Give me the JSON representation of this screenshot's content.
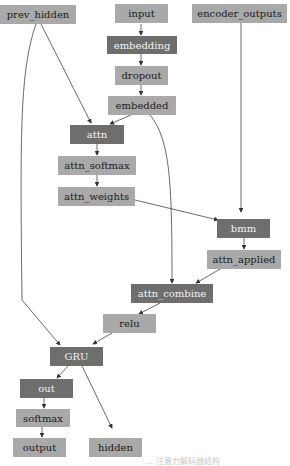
{
  "diagram": {
    "type": "computation-graph",
    "nodes": [
      {
        "id": "prev_hidden",
        "label": "prev_hidden",
        "style": "light"
      },
      {
        "id": "input",
        "label": "input",
        "style": "light"
      },
      {
        "id": "encoder_outputs",
        "label": "encoder_outputs",
        "style": "light"
      },
      {
        "id": "embedding",
        "label": "embedding",
        "style": "dark"
      },
      {
        "id": "dropout",
        "label": "dropout",
        "style": "light"
      },
      {
        "id": "embedded",
        "label": "embedded",
        "style": "light"
      },
      {
        "id": "attn",
        "label": "attn",
        "style": "dark"
      },
      {
        "id": "attn_softmax",
        "label": "attn_softmax",
        "style": "light"
      },
      {
        "id": "attn_weights",
        "label": "attn_weights",
        "style": "light"
      },
      {
        "id": "bmm",
        "label": "bmm",
        "style": "dark"
      },
      {
        "id": "attn_applied",
        "label": "attn_applied",
        "style": "light"
      },
      {
        "id": "attn_combine",
        "label": "attn_combine",
        "style": "dark"
      },
      {
        "id": "relu",
        "label": "relu",
        "style": "light"
      },
      {
        "id": "GRU",
        "label": "GRU",
        "style": "dark"
      },
      {
        "id": "out",
        "label": "out",
        "style": "dark"
      },
      {
        "id": "softmax",
        "label": "softmax",
        "style": "light"
      },
      {
        "id": "output",
        "label": "output",
        "style": "light"
      },
      {
        "id": "hidden",
        "label": "hidden",
        "style": "light"
      }
    ],
    "edges": [
      [
        "input",
        "embedding"
      ],
      [
        "embedding",
        "dropout"
      ],
      [
        "dropout",
        "embedded"
      ],
      [
        "prev_hidden",
        "attn"
      ],
      [
        "embedded",
        "attn"
      ],
      [
        "attn",
        "attn_softmax"
      ],
      [
        "attn_softmax",
        "attn_weights"
      ],
      [
        "attn_weights",
        "bmm"
      ],
      [
        "encoder_outputs",
        "bmm"
      ],
      [
        "bmm",
        "attn_applied"
      ],
      [
        "embedded",
        "attn_combine"
      ],
      [
        "attn_applied",
        "attn_combine"
      ],
      [
        "attn_combine",
        "relu"
      ],
      [
        "relu",
        "GRU"
      ],
      [
        "prev_hidden",
        "GRU"
      ],
      [
        "GRU",
        "out"
      ],
      [
        "GRU",
        "hidden"
      ],
      [
        "out",
        "softmax"
      ],
      [
        "softmax",
        "output"
      ]
    ],
    "colors": {
      "light_node": "#a9a9a9",
      "dark_node": "#6e6e6e",
      "edge": "#333333"
    },
    "caption": "… 注意力解码器结构"
  }
}
